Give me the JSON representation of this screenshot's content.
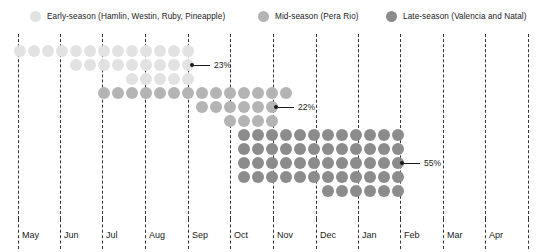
{
  "chart_data": {
    "type": "dot-matrix",
    "title": "",
    "xlabel": "",
    "ylabel": "",
    "grid": true,
    "legend_position": "top",
    "x_tick_labels": [
      "May",
      "Jun",
      "Jul",
      "Aug",
      "Sep",
      "Oct",
      "Nov",
      "Dec",
      "Jan",
      "Feb",
      "Mar",
      "Apr"
    ],
    "x_tick_positions": [
      18,
      60,
      102,
      145,
      188,
      230,
      273,
      316,
      358,
      400,
      443,
      485,
      528
    ],
    "series": [
      {
        "name": "Early-season (Hamlin, Westin, Ruby, Pineapple)",
        "short_name": "Early-season",
        "varieties": "Hamlin, Westin, Ruby, Pineapple",
        "color": "#e2e2e2",
        "share_label": "23%",
        "share_value": 23,
        "dot_count": 31,
        "harvest_start": "May",
        "harvest_end": "Sep",
        "rows": [
          {
            "y": 11,
            "x_start": 14,
            "count": 13
          },
          {
            "y": 25,
            "x_start": 70,
            "count": 9
          },
          {
            "y": 39,
            "x_start": 126,
            "count": 5
          }
        ]
      },
      {
        "name": "Mid-season (Pera Rio)",
        "short_name": "Mid-season",
        "varieties": "Pera Rio",
        "color": "#b4b4b4",
        "share_label": "22%",
        "share_value": 22,
        "dot_count": 30,
        "harvest_start": "Jul",
        "harvest_end": "Nov",
        "rows": [
          {
            "y": 53,
            "x_start": 98,
            "count": 14
          },
          {
            "y": 67,
            "x_start": 196,
            "count": 6
          },
          {
            "y": 81,
            "x_start": 224,
            "count": 4
          }
        ]
      },
      {
        "name": "Late-season (Valencia and Natal)",
        "short_name": "Late-season",
        "varieties": "Valencia and Natal",
        "color": "#8c8c8c",
        "share_label": "55%",
        "share_value": 55,
        "dot_count": 59,
        "harvest_start": "Oct",
        "harvest_end": "Feb",
        "rows": [
          {
            "y": 95,
            "x_start": 238,
            "count": 12
          },
          {
            "y": 109,
            "x_start": 238,
            "count": 12
          },
          {
            "y": 123,
            "x_start": 238,
            "count": 12
          },
          {
            "y": 137,
            "x_start": 238,
            "count": 12
          },
          {
            "y": 151,
            "x_start": 322,
            "count": 6
          }
        ]
      }
    ],
    "annotations": [
      {
        "label": "23%",
        "marker_x": 190,
        "marker_y": 25,
        "series": "Early-season"
      },
      {
        "label": "22%",
        "marker_x": 274,
        "marker_y": 67,
        "series": "Mid-season"
      },
      {
        "label": "55%",
        "marker_x": 400,
        "marker_y": 123,
        "series": "Late-season"
      }
    ],
    "legend": [
      {
        "label": "Early-season (Hamlin, Westin, Ruby, Pineapple)",
        "color": "#e2e2e2",
        "x": 30
      },
      {
        "label": "Mid-season (Pera Rio)",
        "color": "#b4b4b4",
        "x": 258
      },
      {
        "label": "Late-season (Valencia and Natal)",
        "color": "#8c8c8c",
        "x": 386
      }
    ],
    "dot_pitch": 14,
    "dot_diameter": 12
  }
}
